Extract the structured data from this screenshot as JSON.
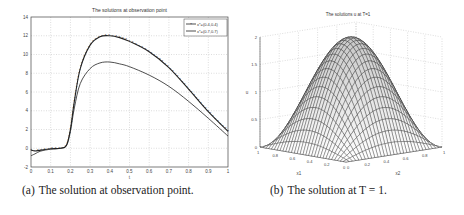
{
  "figure_a": {
    "caption_label": "(a)",
    "caption_text": "The solution at observation point.",
    "title": "The solutions at observation point",
    "xlabel": "t",
    "legend": [
      "x*=(0.4,0.4)",
      "x*=(0.7,0.7)"
    ]
  },
  "figure_b": {
    "caption_label": "(b)",
    "caption_text": "The solution at T = 1.",
    "title": "The solutions u at T=1",
    "zlabel": "u",
    "x1label": "x1",
    "x2label": "x2"
  },
  "chart_data": [
    {
      "type": "line",
      "title": "The solutions at observation point",
      "xlabel": "t",
      "ylabel": "",
      "xlim": [
        0,
        1
      ],
      "ylim": [
        -2,
        14
      ],
      "xticks": [
        0,
        0.1,
        0.2,
        0.3,
        0.4,
        0.5,
        0.6,
        0.7,
        0.8,
        0.9,
        1
      ],
      "yticks": [
        -2,
        0,
        2,
        4,
        6,
        8,
        10,
        12,
        14
      ],
      "grid": true,
      "legend_position": "upper right",
      "x": [
        0,
        0.02,
        0.05,
        0.1,
        0.15,
        0.18,
        0.2,
        0.22,
        0.25,
        0.3,
        0.35,
        0.4,
        0.45,
        0.5,
        0.6,
        0.7,
        0.8,
        0.9,
        1.0
      ],
      "series": [
        {
          "name": "x*=(0.4,0.4)",
          "marker": "*",
          "values": [
            -0.2,
            -0.3,
            -0.2,
            -0.05,
            0.0,
            0.3,
            2.0,
            5.0,
            8.5,
            11.0,
            11.9,
            12.0,
            11.8,
            11.4,
            10.3,
            8.6,
            6.3,
            3.9,
            1.8
          ]
        },
        {
          "name": "x*=(0.7,0.7)",
          "marker": "none",
          "values": [
            -0.8,
            -0.6,
            -0.3,
            -0.1,
            0.0,
            0.3,
            1.8,
            4.3,
            6.9,
            8.5,
            9.1,
            9.2,
            9.0,
            8.7,
            7.8,
            6.6,
            5.0,
            3.2,
            1.3
          ]
        }
      ]
    },
    {
      "type": "surface",
      "title": "The solutions u at T=1",
      "xlabel": "x1",
      "ylabel": "x2",
      "zlabel": "u",
      "xlim": [
        0,
        1
      ],
      "ylim": [
        0,
        1
      ],
      "zlim": [
        0,
        2
      ],
      "zticks": [
        0,
        0.5,
        1,
        1.5,
        2
      ],
      "xticks": [
        0,
        0.2,
        0.4,
        0.6,
        0.8,
        1
      ],
      "yticks": [
        0,
        0.2,
        0.4,
        0.6,
        0.8,
        1
      ],
      "grid": true,
      "description": "Bell-shaped surface u = 2·sin(πx1)·sin(πx2), peak 2 at (0.5,0.5)"
    }
  ]
}
